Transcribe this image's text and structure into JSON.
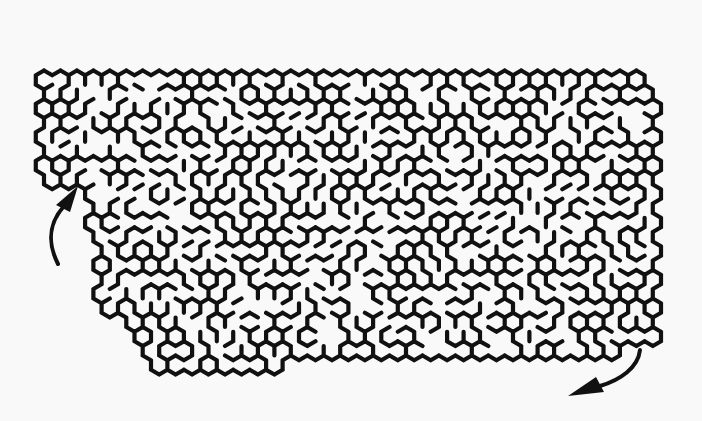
{
  "puzzle": {
    "type": "hexagonal maze",
    "entrance_arrow": {
      "position": "left",
      "direction": "up-right into maze"
    },
    "exit_arrow": {
      "position": "bottom-right",
      "direction": "down-left out of maze"
    },
    "colors": {
      "background": "#f9f9f9",
      "walls": "#111111"
    }
  }
}
